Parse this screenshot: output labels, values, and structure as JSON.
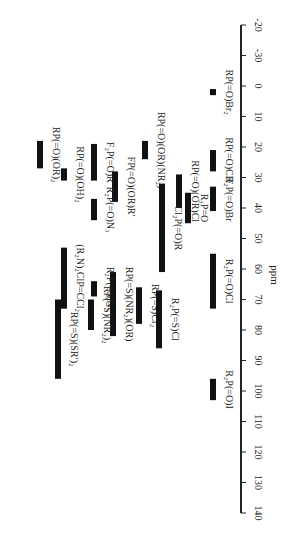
{
  "chart_data": {
    "type": "bar",
    "orientation": "rotated-range-bars",
    "title": "",
    "xlabel": "ppm",
    "ylabel": "",
    "axis": {
      "range": [
        -20,
        140
      ],
      "ticks": [
        -20,
        -10,
        0,
        10,
        20,
        30,
        40,
        50,
        60,
        70,
        80,
        90,
        100,
        110,
        120,
        130,
        140
      ],
      "tick_labels": [
        "-20",
        "-30",
        "0",
        "10",
        "20",
        "30",
        "40",
        "50",
        "60",
        "70",
        "80",
        "90",
        "100",
        "110",
        "120",
        "130",
        "140"
      ],
      "grid": false
    },
    "series": [
      {
        "name": "RP(=O)Br2",
        "label": "RP(=O)Br₂",
        "range": [
          1,
          3
        ],
        "col": 213
      },
      {
        "name": "RP(=O)ClF",
        "label": "RP(=O)ClF",
        "range": [
          21,
          28
        ],
        "col": 213
      },
      {
        "name": "R2P(=O)Br",
        "label": "R₂P(=O)Br",
        "range": [
          33,
          41
        ],
        "col": 213
      },
      {
        "name": "R3P=O",
        "label": "R₃P=O",
        "range": [
          35,
          45
        ],
        "col": 188
      },
      {
        "name": "R2P(=O)Cl",
        "label": "R₂P(=O)Cl",
        "range": [
          55,
          73
        ],
        "col": 213
      },
      {
        "name": "R2P(=O)I",
        "label": "R₂P(=O)I",
        "range": [
          96,
          103
        ],
        "col": 213
      },
      {
        "name": "RP(=O)(OR)(NR2)",
        "label": "RP(=O)(OR)(NR₂)",
        "range": [
          18,
          24
        ],
        "col": 145
      },
      {
        "name": "RP(=O)(OR)Cl",
        "label": "RP(=O)(OR)Cl",
        "range": [
          29,
          40
        ],
        "col": 179
      },
      {
        "name": "Cl2P(=O)R",
        "label": "Cl₂P(=O)R",
        "range": [
          32,
          61
        ],
        "col": 162
      },
      {
        "name": "FP(=O)(OR)R'",
        "label": "FP(=O)(OR)R′",
        "range": [
          28,
          38
        ],
        "col": 115
      },
      {
        "name": "RP(=S)Cl2",
        "label": "RP(=S)Cl₂",
        "range": [
          66,
          78
        ],
        "col": 139
      },
      {
        "name": "R2P(=S)Cl",
        "label": "R₂P(=S)Cl",
        "range": [
          67,
          86
        ],
        "col": 159
      },
      {
        "name": "RP(=S)(NR2)(OR)",
        "label": "RP(=S)(NR₂)(OR)",
        "range": [
          61,
          82
        ],
        "col": 113
      },
      {
        "name": "RP(=S)(NR2)2",
        "label": "RP(=S)(NR₂)₂",
        "range": [
          70,
          80
        ],
        "col": 91
      },
      {
        "name": "R2P(=S)N3",
        "label": "R₂P(=S)N₃",
        "range": [
          64,
          69
        ],
        "col": 94
      },
      {
        "name": "RP(=S)(SR')2",
        "label": "RP(=S)(SR′)₂",
        "range": [
          70,
          96
        ],
        "col": 58
      },
      {
        "name": "(R2N)2ClP=CCl2",
        "label": "(R₂N)₂ClP=CCl₂",
        "range": [
          53,
          73
        ],
        "col": 64
      },
      {
        "name": "R2P(=O)N3",
        "label": "R₂P(=O)N₃",
        "range": [
          37,
          44
        ],
        "col": 94
      },
      {
        "name": "F2P(=O)R",
        "label": "F₂P(=O)R",
        "range": [
          19,
          31
        ],
        "col": 94
      },
      {
        "name": "RP(=O)(OH)2",
        "label": "RP(=O)(OH)₂",
        "range": [
          27,
          31
        ],
        "col": 64
      },
      {
        "name": "RP(=O)(OR)2",
        "label": "RP(=O)(OR)₂",
        "range": [
          18,
          27
        ],
        "col": 40
      }
    ]
  }
}
